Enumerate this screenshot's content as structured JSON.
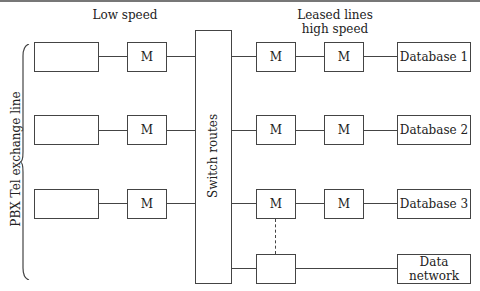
{
  "diagram": {
    "headers": {
      "low_speed": "Low speed",
      "leased_lines": "Leased lines",
      "high_speed": "high speed"
    },
    "side_label": "PBX Tel exchange line",
    "switch_label": "Switch routes",
    "rows": [
      {
        "left_box": "",
        "modem_left": "M",
        "modem_right_1": "M",
        "modem_right_2": "M",
        "destination": "Database 1"
      },
      {
        "left_box": "",
        "modem_left": "M",
        "modem_right_1": "M",
        "modem_right_2": "M",
        "destination": "Database 2"
      },
      {
        "left_box": "",
        "modem_left": "M",
        "modem_right_1": "M",
        "modem_right_2": "M",
        "destination": "Database 3"
      }
    ],
    "bottom": {
      "box": "",
      "destination_line1": "Data",
      "destination_line2": "network"
    }
  }
}
